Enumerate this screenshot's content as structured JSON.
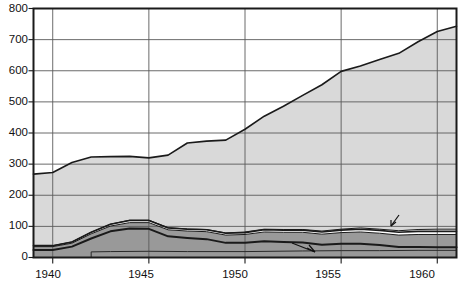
{
  "chart_data": {
    "type": "area",
    "title": "",
    "subtitle": "",
    "xlabel": "",
    "ylabel": "",
    "xlim": [
      1939,
      1961
    ],
    "ylim": [
      0,
      800
    ],
    "grid": true,
    "legend": "inline-annotations",
    "stacked": true,
    "x_ticks": [
      "1940",
      "1945",
      "1950",
      "1955",
      "1960"
    ],
    "x_tick_values": [
      1940,
      1945,
      1950,
      1955,
      1960
    ],
    "y_ticks": [
      "0",
      "100",
      "200",
      "300",
      "400",
      "500",
      "600",
      "700",
      "800"
    ],
    "y_tick_values": [
      0,
      100,
      200,
      300,
      400,
      500,
      600,
      700,
      800
    ],
    "x": [
      1939,
      1940,
      1941,
      1942,
      1943,
      1944,
      1945,
      1946,
      1947,
      1948,
      1949,
      1950,
      1951,
      1952,
      1953,
      1954,
      1955,
      1956,
      1957,
      1958,
      1959,
      1960,
      1961
    ],
    "series": [
      {
        "name": "Railroads",
        "label": "Railroads",
        "color": "#999999",
        "values": [
          24,
          24,
          35,
          61,
          84,
          93,
          92,
          68,
          63,
          59,
          47,
          47,
          52,
          50,
          48,
          41,
          44,
          44,
          40,
          34,
          34,
          33,
          33
        ]
      },
      {
        "name": "Motor carriers",
        "label": "Motor carriers",
        "color": "#9a9a9a",
        "values": [
          11,
          11,
          11,
          15,
          17,
          19,
          20,
          21,
          22,
          24,
          25,
          27,
          30,
          31,
          33,
          34,
          36,
          38,
          38,
          38,
          40,
          41,
          41
        ]
      },
      {
        "name": "Inland waterways",
        "label": "Inland waterways",
        "color": "#ffffff",
        "values": [
          3,
          3,
          4,
          5,
          6,
          7,
          7,
          6,
          6,
          6,
          6,
          6,
          7,
          7,
          7,
          7,
          8,
          9,
          9,
          9,
          10,
          10,
          10
        ]
      },
      {
        "name": "Airlines",
        "label": "Airlines",
        "color": "#ffffff",
        "values": [
          0,
          0,
          0,
          0,
          0,
          1,
          1,
          1,
          1,
          1,
          1,
          2,
          2,
          2,
          2,
          3,
          3,
          4,
          4,
          5,
          6,
          7,
          7
        ]
      },
      {
        "name": "Private automobiles",
        "label": "Private automobiles",
        "color": "#d9d9d9",
        "values": [
          230,
          235,
          255,
          242,
          217,
          205,
          200,
          233,
          276,
          284,
          298,
          330,
          363,
          396,
          431,
          470,
          507,
          520,
          545,
          570,
          603,
          635,
          652
        ]
      }
    ],
    "totals": [
      268,
      273,
      305,
      323,
      324,
      325,
      320,
      329,
      368,
      374,
      377,
      412,
      454,
      486,
      521,
      555,
      598,
      615,
      636,
      656,
      693,
      726,
      743
    ]
  },
  "annotations": [
    {
      "name": "private-automobiles",
      "text": "Private automobiles"
    },
    {
      "name": "railroads",
      "text": "Railroads"
    },
    {
      "name": "motor-carriers",
      "text": "Motor carriers"
    },
    {
      "name": "inland-waterways",
      "text": "Inland waterways"
    },
    {
      "name": "airlines",
      "text": "Airlines"
    }
  ],
  "axes": {
    "y_labels": [
      "800",
      "700",
      "600",
      "500",
      "400",
      "300",
      "200",
      "100",
      "0"
    ],
    "x_labels": [
      "1940",
      "1945",
      "1950",
      "1955",
      "1960"
    ]
  },
  "colors": {
    "automobiles_fill": "#d9d9d9",
    "railroads_fill": "#999999",
    "motor_fill": "#9a9a9a",
    "white_band": "#ffffff",
    "axis": "#1a1a1a",
    "grid": "#5a5a5a",
    "text": "#111111"
  }
}
